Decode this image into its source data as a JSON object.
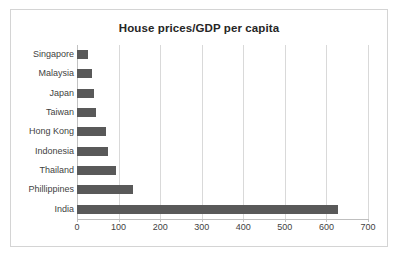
{
  "chart_data": {
    "type": "bar",
    "orientation": "horizontal",
    "title": "House prices/GDP per capita",
    "xlabel": "",
    "ylabel": "",
    "categories": [
      "Singapore",
      "Malaysia",
      "Japan",
      "Taiwan",
      "Hong Kong",
      "Indonesia",
      "Thailand",
      "Phillippines",
      "India"
    ],
    "values": [
      26,
      36,
      40,
      46,
      70,
      75,
      94,
      134,
      627
    ],
    "xlim": [
      0,
      700
    ],
    "xticks": [
      0,
      100,
      200,
      300,
      400,
      500,
      600,
      700
    ],
    "xtick_labels": [
      "0",
      "100",
      "200",
      "300",
      "400",
      "500",
      "600",
      "700"
    ],
    "grid": "vertical",
    "legend": "none",
    "series": [
      {
        "name": "House prices/GDP per capita",
        "values": [
          26,
          36,
          40,
          46,
          70,
          75,
          94,
          134,
          627
        ]
      }
    ],
    "colors": {
      "bar": "#595959",
      "gridline": "#d9d9d9",
      "axis": "#bfbfbf",
      "border": "#d4d4d4",
      "text": "#3f3f3f",
      "title_text": "#262626",
      "background": "#ffffff"
    }
  }
}
